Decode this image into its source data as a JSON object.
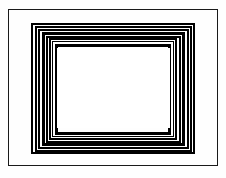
{
  "figure": {
    "canvas": {
      "width": 226,
      "height": 178
    },
    "colors": {
      "background": "#ffffff",
      "page": "#fefefe",
      "ink": "#000000",
      "gap": "#ffffff"
    },
    "outer_border": {
      "name": "outer-border",
      "x": 8,
      "y": 9,
      "width": 210,
      "height": 157,
      "stroke": 1.2,
      "color": "#1a1a1a"
    },
    "center_panel": {
      "name": "center-blank-panel",
      "x": 57,
      "y": 48,
      "width": 113,
      "height": 80,
      "fill": "#ffffff"
    },
    "ring_count": 8,
    "rings": [
      {
        "index": 0,
        "name": "ring-1",
        "x": 31,
        "y": 23,
        "width": 164,
        "height": 131,
        "stroke": 2.4
      },
      {
        "index": 1,
        "name": "ring-2",
        "x": 34.5,
        "y": 26,
        "width": 157,
        "height": 125.5,
        "stroke": 2.0
      },
      {
        "index": 2,
        "name": "ring-3",
        "x": 37.5,
        "y": 28.6,
        "width": 151,
        "height": 120.5,
        "stroke": 2.6
      },
      {
        "index": 3,
        "name": "ring-4",
        "x": 41.5,
        "y": 32,
        "width": 143,
        "height": 113.8,
        "stroke": 3.0
      },
      {
        "index": 4,
        "name": "ring-5",
        "x": 45.5,
        "y": 35.5,
        "width": 135,
        "height": 107,
        "stroke": 2.2
      },
      {
        "index": 5,
        "name": "ring-6",
        "x": 48.8,
        "y": 38.4,
        "width": 128.5,
        "height": 101.4,
        "stroke": 2.4
      },
      {
        "index": 6,
        "name": "ring-7",
        "x": 52.2,
        "y": 41.4,
        "width": 121.8,
        "height": 95.5,
        "stroke": 1.8
      },
      {
        "index": 7,
        "name": "ring-8",
        "x": 55,
        "y": 44,
        "width": 116.4,
        "height": 90.6,
        "stroke": 3.4
      }
    ]
  }
}
